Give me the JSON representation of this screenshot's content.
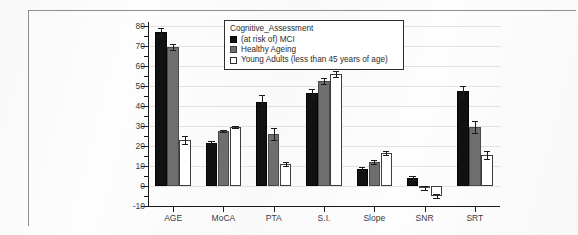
{
  "chart_data": {
    "type": "bar",
    "title": "",
    "xlabel": "",
    "ylabel": "",
    "ylim": [
      -10,
      82
    ],
    "grid": true,
    "legend_position": "top-center",
    "legend_title": "Cognitive_Assessment",
    "categories": [
      "AGE",
      "MoCA",
      "PTA",
      "S.I.",
      "Slope",
      "SNR",
      "SRT"
    ],
    "ytick_labels": [
      "80",
      "70",
      "60",
      "50",
      "40",
      "30",
      "20",
      "10",
      "0",
      "-10"
    ],
    "ytick_values": [
      80,
      70,
      60,
      50,
      40,
      30,
      20,
      10,
      0,
      -10
    ],
    "series": [
      {
        "name": "(at risk of) MCI",
        "color": "#111111",
        "values": [
          77.0,
          21.5,
          42.0,
          46.5,
          8.5,
          4.0,
          47.5
        ],
        "errors": [
          2.0,
          0.8,
          3.5,
          2.0,
          1.0,
          1.2,
          2.5
        ]
      },
      {
        "name": "Healthy Ageing",
        "color": "#6e6e6e",
        "values": [
          69.5,
          27.5,
          26.0,
          52.5,
          12.0,
          -0.8,
          29.5
        ],
        "errors": [
          1.3,
          0.7,
          3.0,
          1.5,
          0.9,
          1.0,
          3.0
        ]
      },
      {
        "name": "Young Adults (less than 45 years of age)",
        "color": "#ffffff",
        "values": [
          23.0,
          29.5,
          11.0,
          56.0,
          16.5,
          -5.0,
          15.5
        ],
        "errors": [
          2.2,
          0.5,
          1.2,
          1.5,
          1.2,
          0.8,
          1.8
        ]
      }
    ]
  },
  "legend": {
    "title": "Cognitive_Assessment",
    "items": [
      {
        "label": "(at risk of) MCI",
        "swatch": "filled-black-square-icon"
      },
      {
        "label": "Healthy Ageing",
        "swatch": "filled-gray-square-icon"
      },
      {
        "label": "Young Adults (less than 45 years of age)",
        "swatch": "empty-white-square-icon"
      }
    ]
  }
}
